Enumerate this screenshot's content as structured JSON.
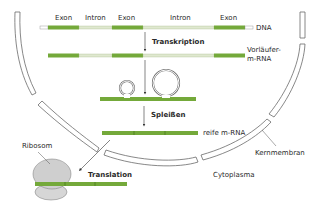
{
  "colors": {
    "exon": "#74a93a",
    "exon_dark": "#4f7f22",
    "intron": "#dfe8cf",
    "membrane_stroke": "#6a6a6a",
    "ribosome": "#cfcfcf",
    "text": "#2a2a2a",
    "background": "#ffffff"
  },
  "dna_row": {
    "labels": [
      "Exon",
      "Intron",
      "Exon",
      "Intron",
      "Exon"
    ],
    "end_label": "DNA"
  },
  "steps": {
    "transcription": "Transkription",
    "splicing": "Spleißen",
    "translation": "Translation"
  },
  "pre_mrna": {
    "label_line1": "Vorläufer-",
    "label_line2": "m-RNA"
  },
  "mature_mrna": {
    "label": "reife m-RNA"
  },
  "cell": {
    "nuclear_membrane_label": "Kernmembran",
    "cytoplasm_label": "Cytoplasma",
    "ribosome_label": "Ribosom"
  }
}
